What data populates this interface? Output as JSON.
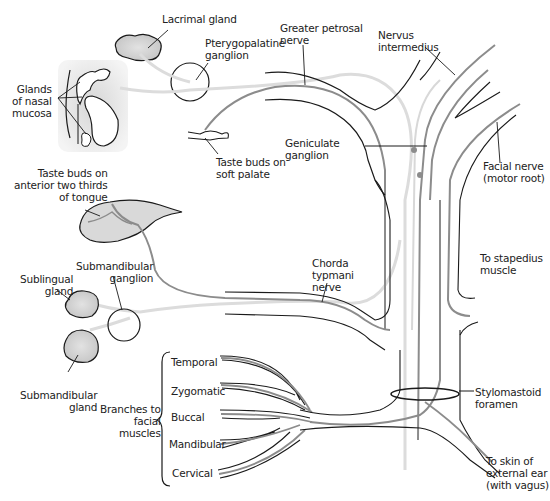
{
  "diagram": {
    "colors": {
      "outline": "#1a1a1a",
      "nerve_gray": "#8c8c8c",
      "nerve_light": "#d8d8d8",
      "gland_fill": "#cfcfcf"
    },
    "labels": {
      "lacrimal_gland": "Lacrimal gland",
      "pterygopalatine_ganglion": "Pterygopalatine\nganglion",
      "greater_petrosal_nerve": "Greater petrosal\nnerve",
      "nervus_intermedius": "Nervus\nintermedius",
      "glands_of_nasal_mucosa": "Glands\nof nasal\nmucosa",
      "taste_buds_soft_palate": "Taste buds on\nsoft palate",
      "geniculate_ganglion": "Geniculate\nganglion",
      "facial_nerve_motor_root": "Facial nerve\n(motor root)",
      "taste_buds_tongue": "Taste buds on\nanterior two thirds\nof tongue",
      "submandibular_ganglion": "Submandibular\nganglion",
      "sublingual_gland": "Sublingual\ngland",
      "chorda_tympani_nerve": "Chorda\ntypmani\nnerve",
      "to_stapedius_muscle": "To stapedius\nmuscle",
      "submandibular_gland": "Submandibular\ngland",
      "branches_to_facial_muscles": "Branches to\nfacial\nmuscles",
      "stylomastoid_foramen": "Stylomastoid\nforamen",
      "to_skin_external_ear": "To skin of\nexternal ear\n(with vagus)"
    },
    "facial_branches": [
      "Temporal",
      "Zygomatic",
      "Buccal",
      "Mandibular",
      "Cervical"
    ]
  }
}
